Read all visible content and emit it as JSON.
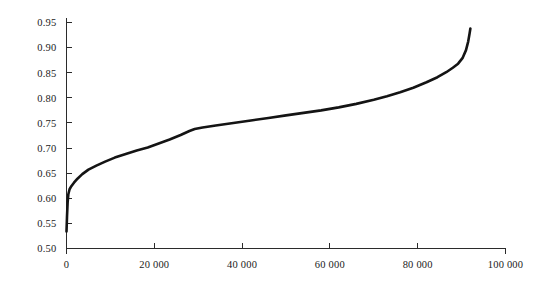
{
  "chart_data": {
    "type": "line",
    "title": "",
    "subtitle": "",
    "xlabel": "",
    "ylabel": "",
    "xlim": [
      0,
      100000
    ],
    "ylim": [
      0.5,
      0.95
    ],
    "grid": false,
    "legend": null,
    "legend_position": "none",
    "line_color": "#141414",
    "background_color": "#ffffff",
    "axis_color": "#2b2b2b",
    "xticks": [
      0,
      20000,
      40000,
      60000,
      80000,
      100000
    ],
    "xtick_labels": [
      "0",
      "20 000",
      "40 000",
      "60 000",
      "80 000",
      "100 000"
    ],
    "yticks": [
      0.5,
      0.55,
      0.6,
      0.65,
      0.7,
      0.75,
      0.8,
      0.85,
      0.9,
      0.95
    ],
    "ytick_labels": [
      "0.50",
      "0.55",
      "0.60",
      "0.65",
      "0.70",
      "0.75",
      "0.80",
      "0.85",
      "0.90",
      "0.95"
    ],
    "series": [
      {
        "name": "sorted values",
        "x": [
          0,
          120,
          260,
          420,
          700,
          1100,
          1700,
          2500,
          3600,
          5000,
          6800,
          8800,
          11000,
          13500,
          16000,
          18500,
          21000,
          23500,
          26000,
          28000,
          29200,
          31000,
          34000,
          38000,
          42000,
          46000,
          50000,
          54000,
          58000,
          62000,
          66000,
          70000,
          73000,
          76000,
          79000,
          82000,
          84500,
          86500,
          88000,
          89200,
          90200,
          91000,
          91500,
          91800,
          92000
        ],
        "y": [
          0.534,
          0.565,
          0.592,
          0.608,
          0.618,
          0.624,
          0.631,
          0.639,
          0.648,
          0.657,
          0.665,
          0.673,
          0.681,
          0.688,
          0.695,
          0.701,
          0.709,
          0.717,
          0.726,
          0.734,
          0.738,
          0.741,
          0.745,
          0.75,
          0.755,
          0.76,
          0.765,
          0.77,
          0.775,
          0.781,
          0.788,
          0.796,
          0.803,
          0.811,
          0.82,
          0.831,
          0.841,
          0.851,
          0.86,
          0.868,
          0.879,
          0.895,
          0.912,
          0.927,
          0.938
        ]
      }
    ]
  }
}
